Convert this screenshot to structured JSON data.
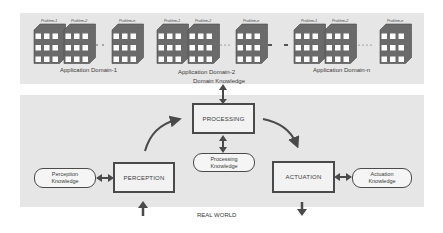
{
  "diagram": {
    "domains": [
      {
        "label": "Application Domain-1",
        "problems": [
          "Problem-1",
          "Problem-2",
          "Problem-n"
        ],
        "stack_x": [
          34,
          64,
          112
        ],
        "label_x": 60
      },
      {
        "label": "Application Domain-2",
        "problems": [
          "Problem-1",
          "Problem-2",
          "Problem-n"
        ],
        "stack_x": [
          157,
          188,
          236
        ],
        "label_x": 178
      },
      {
        "label": "Application Domain-n",
        "problems": [
          "Problem-1",
          "Problem-2",
          "Problem-n"
        ],
        "stack_x": [
          294,
          325,
          380
        ],
        "label_x": 313
      }
    ],
    "domain_knowledge_label": "Domain Knowledge",
    "processing_label": "PROCESSING",
    "perception_label": "PERCEPTION",
    "actuation_label": "ACTUATION",
    "processing_knowledge": {
      "line1": "Processing",
      "line2": "Knowledge"
    },
    "perception_knowledge": {
      "line1": "Perception",
      "line2": "Knowledge"
    },
    "actuation_knowledge": {
      "line1": "Actuation",
      "line2": "Knowledge"
    },
    "real_world_label": "REAL WORLD",
    "colors": {
      "panel": "#e6e6e6",
      "stroke": "#4a4a4a",
      "cube_face": "#ffffff"
    }
  }
}
